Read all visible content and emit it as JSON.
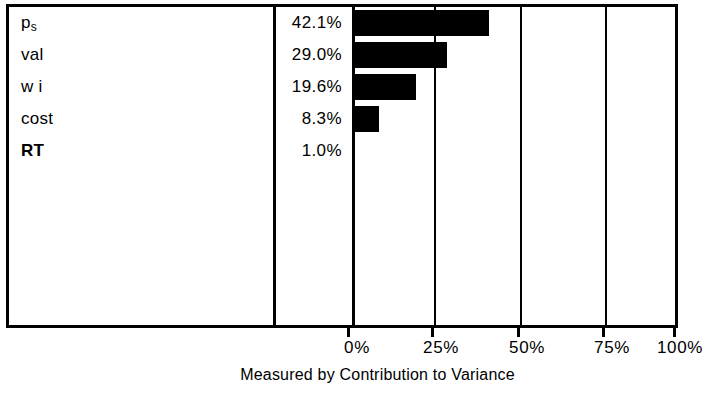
{
  "chart_data": {
    "type": "bar",
    "orientation": "horizontal",
    "title": "",
    "xlabel": "Measured by Contribution to Variance",
    "ylabel": "",
    "xlim": [
      0,
      100
    ],
    "grid": true,
    "legend": null,
    "categories": [
      "p_s",
      "val",
      "wi",
      "cost",
      "RT"
    ],
    "values": [
      42.1,
      29.0,
      19.6,
      8.3,
      1.0
    ],
    "tick_labels": [
      "0%",
      "25%",
      "50%",
      "75%",
      "100%"
    ],
    "tick_values": [
      0,
      25,
      50,
      75,
      100
    ],
    "bar_color": "#000000",
    "background_color": "#ffffff",
    "rows": [
      {
        "label": "p",
        "sub": "s",
        "bold": false,
        "value_text": "42.1%",
        "value": 42.1
      },
      {
        "label": "val",
        "sub": "",
        "bold": false,
        "value_text": "29.0%",
        "value": 29.0
      },
      {
        "label": "w i",
        "sub": "",
        "bold": false,
        "value_text": "19.6%",
        "value": 19.6
      },
      {
        "label": "cost",
        "sub": "",
        "bold": false,
        "value_text": "8.3%",
        "value": 8.3
      },
      {
        "label": "RT",
        "sub": "",
        "bold": true,
        "value_text": "1.0%",
        "value": 1.0
      }
    ]
  }
}
